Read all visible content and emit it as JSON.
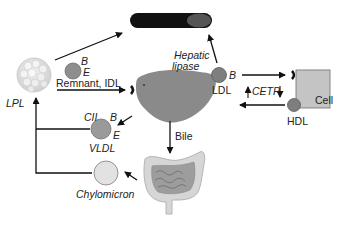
{
  "labels": {
    "lpl": "LPL",
    "remnant_idl": "Remnant, IDL",
    "remnant_b": "B",
    "remnant_e": "E",
    "hepatic_lipase_line1": "Hepatic",
    "hepatic_lipase_line2": "lipase",
    "ldl": "LDL",
    "ldl_b": "B",
    "cetp": "CETP",
    "cell": "Cell",
    "hdl": "HDL",
    "bile": "Bile",
    "vldl": "VLDL",
    "vldl_cii": "CII",
    "vldl_b": "B",
    "vldl_e": "E",
    "chylomicron": "Chylomicron"
  },
  "colors": {
    "lipoprotein_gray": "#8e8e8e",
    "liver_gray": "#8a8a8a",
    "chylomicron_fill": "#e2e2e2",
    "cell_fill": "#c4c4c4",
    "artery_dark": "#111111",
    "line": "#111111"
  }
}
